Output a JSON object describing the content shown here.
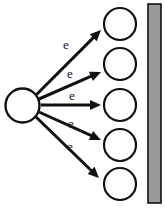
{
  "diagram": {
    "background_color": "#ffffff",
    "stroke_color": "#111111",
    "source": {
      "name": "source-circle",
      "cx": 22.5,
      "cy": 105.5,
      "r": 17.0,
      "fill": "#ffffff",
      "stroke_width": 2.4
    },
    "targets": [
      {
        "label": "target-circle-1",
        "cx": 120,
        "cy": 24,
        "r": 16.0
      },
      {
        "label": "target-circle-2",
        "cx": 120,
        "cy": 64,
        "r": 16.0
      },
      {
        "label": "target-circle-3",
        "cx": 120,
        "cy": 105,
        "r": 16.0
      },
      {
        "label": "target-circle-4",
        "cx": 120,
        "cy": 145,
        "r": 16.0
      },
      {
        "label": "target-circle-5",
        "cx": 120,
        "cy": 184,
        "r": 16.0
      }
    ],
    "target_style": {
      "fill": "#ffffff",
      "stroke_width": 2.2
    },
    "arrows": [
      {
        "name": "electron-arrow-1",
        "label": "e",
        "x1": 36,
        "y1": 95,
        "x2": 101,
        "y2": 30,
        "label_x": 66,
        "label_y": 46
      },
      {
        "name": "electron-arrow-2",
        "label": "e",
        "x1": 39,
        "y1": 99,
        "x2": 101,
        "y2": 72,
        "label_x": 70,
        "label_y": 75
      },
      {
        "name": "electron-arrow-3",
        "label": "e",
        "x1": 41,
        "y1": 105,
        "x2": 101,
        "y2": 105,
        "label_x": 72,
        "label_y": 97
      },
      {
        "name": "electron-arrow-4",
        "label": "e",
        "x1": 39,
        "y1": 112,
        "x2": 101,
        "y2": 140,
        "label_x": 71,
        "label_y": 125
      },
      {
        "name": "electron-arrow-5",
        "label": "e",
        "x1": 36,
        "y1": 117,
        "x2": 99,
        "y2": 178,
        "label_x": 70,
        "label_y": 148
      }
    ],
    "arrow_style": {
      "stroke_width": 3.0,
      "head_length": 11,
      "head_width": 10
    },
    "bar": {
      "name": "absorber-bar",
      "x": 148,
      "y": 4,
      "width": 13,
      "height": 199,
      "fill": "#9a9a9a",
      "stroke": "#111111",
      "stroke_width": 1.6
    }
  }
}
